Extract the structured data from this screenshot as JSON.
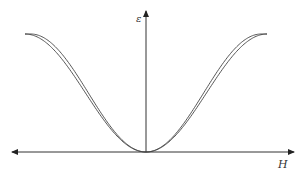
{
  "diagram": {
    "title": "",
    "y_axis_label": "ε",
    "x_axis_label": "H",
    "x_axis_arrows": "both",
    "y_axis_arrows": "up",
    "curves": [
      {
        "name": "curve-1",
        "shape": "symmetric bell-inverted (butterfly)",
        "color": "#444444"
      },
      {
        "name": "curve-2",
        "shape": "symmetric bell-inverted (butterfly)",
        "color": "#444444"
      }
    ]
  }
}
